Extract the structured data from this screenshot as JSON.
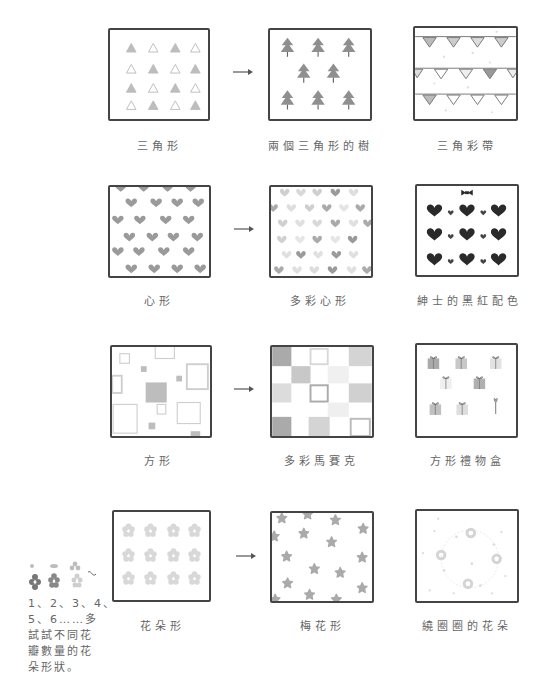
{
  "rows": [
    {
      "items": [
        {
          "label": "三角形",
          "motif": "triangle-icon"
        },
        {
          "label": "兩個三角形的樹",
          "motif": "tree-icon"
        },
        {
          "label": "三角彩帶",
          "motif": "bunting-icon"
        }
      ]
    },
    {
      "items": [
        {
          "label": "心形",
          "motif": "heart-icon"
        },
        {
          "label": "多彩心形",
          "motif": "heart-icon"
        },
        {
          "label": "紳士的黑紅配色",
          "motif": "heart-bow-icon"
        }
      ]
    },
    {
      "items": [
        {
          "label": "方形",
          "motif": "square-icon"
        },
        {
          "label": "多彩馬賽克",
          "motif": "mosaic-icon"
        },
        {
          "label": "方形禮物盒",
          "motif": "gift-box-icon"
        }
      ]
    },
    {
      "items": [
        {
          "label": "花朵形",
          "motif": "flower-icon"
        },
        {
          "label": "梅花形",
          "motif": "plum-blossom-icon"
        },
        {
          "label": "繞圈圈的花朵",
          "motif": "flower-ring-icon"
        }
      ]
    }
  ],
  "arrow_symbol": "→",
  "side_note": {
    "lines": [
      "1、2、3、4、",
      "5、6……多",
      "試試不同花",
      "瓣數量的花",
      "朵形狀。"
    ]
  },
  "colors": {
    "outline": "#444444",
    "motif_gray": "#9a9a9a",
    "motif_light": "#cfcfcf",
    "motif_dark": "#2a2a2a"
  }
}
